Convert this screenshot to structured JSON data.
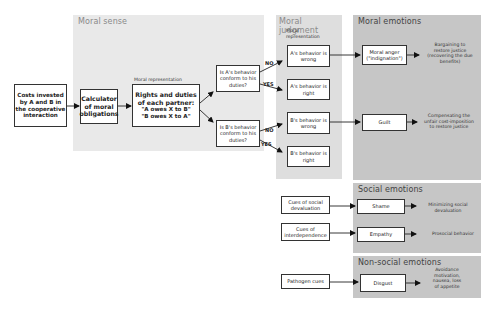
{
  "panels": {
    "moral_sense": "Moral sense",
    "moral_judgment": "Moral judgment",
    "moral_emotions": "Moral emotions",
    "social_emotions": "Social emotions",
    "non_social_emotions": "Non-social emotions"
  },
  "inputs": {
    "costs": "Costs invested\nby A and B in\nthe cooperative\ninteraction",
    "calculator": "Calculator\nof moral\nobligations"
  },
  "moral_representation_label": "Moral representation",
  "rights": {
    "title": "Rights and duties\nof each partner:",
    "line1": "\"A owes X to B\"",
    "line2": "\"B owes X to A\""
  },
  "questions": {
    "a": "Is A's behavior\nconform to his\nduties?",
    "b": "Is B's behavior\nconform to his\nduties?"
  },
  "branches": {
    "no": "NO",
    "yes": "YES"
  },
  "judgment_label": "Moral\nrepresentation",
  "judgments": {
    "a_wrong": "A's behavior is\nwrong",
    "a_right": "A's behavior is\nright",
    "b_wrong": "B's behavior is\nwrong",
    "b_right": "B's behavior is\nright"
  },
  "emotions": {
    "anger": "Moral anger\n(\"indignation\")",
    "guilt": "Guilt",
    "shame": "Shame",
    "empathy": "Empathy",
    "disgust": "Disgust"
  },
  "outcomes": {
    "anger": "Bargaining to\nrestore justice\n(recovering the due\nbenefits)",
    "guilt": "Compensating the\nunfair cost-imposition\nto restore justice",
    "shame": "Minimizing social\ndevaluation",
    "empathy": "Prosocial behavior",
    "disgust": "Avoidance\nmotivation,\nnausea, loss\nof appetite"
  },
  "cues": {
    "social_devaluation": "Cues of social\ndevaluation",
    "interdependence": "Cues of\ninterdependence",
    "pathogen": "Pathogen cues"
  }
}
